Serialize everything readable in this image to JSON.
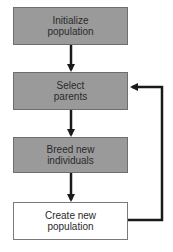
{
  "diagram": {
    "type": "flowchart",
    "nodes": [
      {
        "id": "init",
        "line1": "Initialize",
        "line2": "population",
        "fill": "#9a9a9a"
      },
      {
        "id": "select",
        "line1": "Select",
        "line2": "parents",
        "fill": "#9a9a9a"
      },
      {
        "id": "breed",
        "line1": "Breed new",
        "line2": "individuals",
        "fill": "#9a9a9a"
      },
      {
        "id": "create",
        "line1": "Create new",
        "line2": "population",
        "fill": "#ffffff"
      }
    ],
    "edges": [
      {
        "from": "init",
        "to": "select"
      },
      {
        "from": "select",
        "to": "breed"
      },
      {
        "from": "breed",
        "to": "create"
      },
      {
        "from": "create",
        "to": "select",
        "style": "loop-back"
      }
    ],
    "colors": {
      "arrow": "#1a1a1a",
      "box_fill": "#9a9a9a",
      "box_border": "#6e6e6e"
    }
  }
}
